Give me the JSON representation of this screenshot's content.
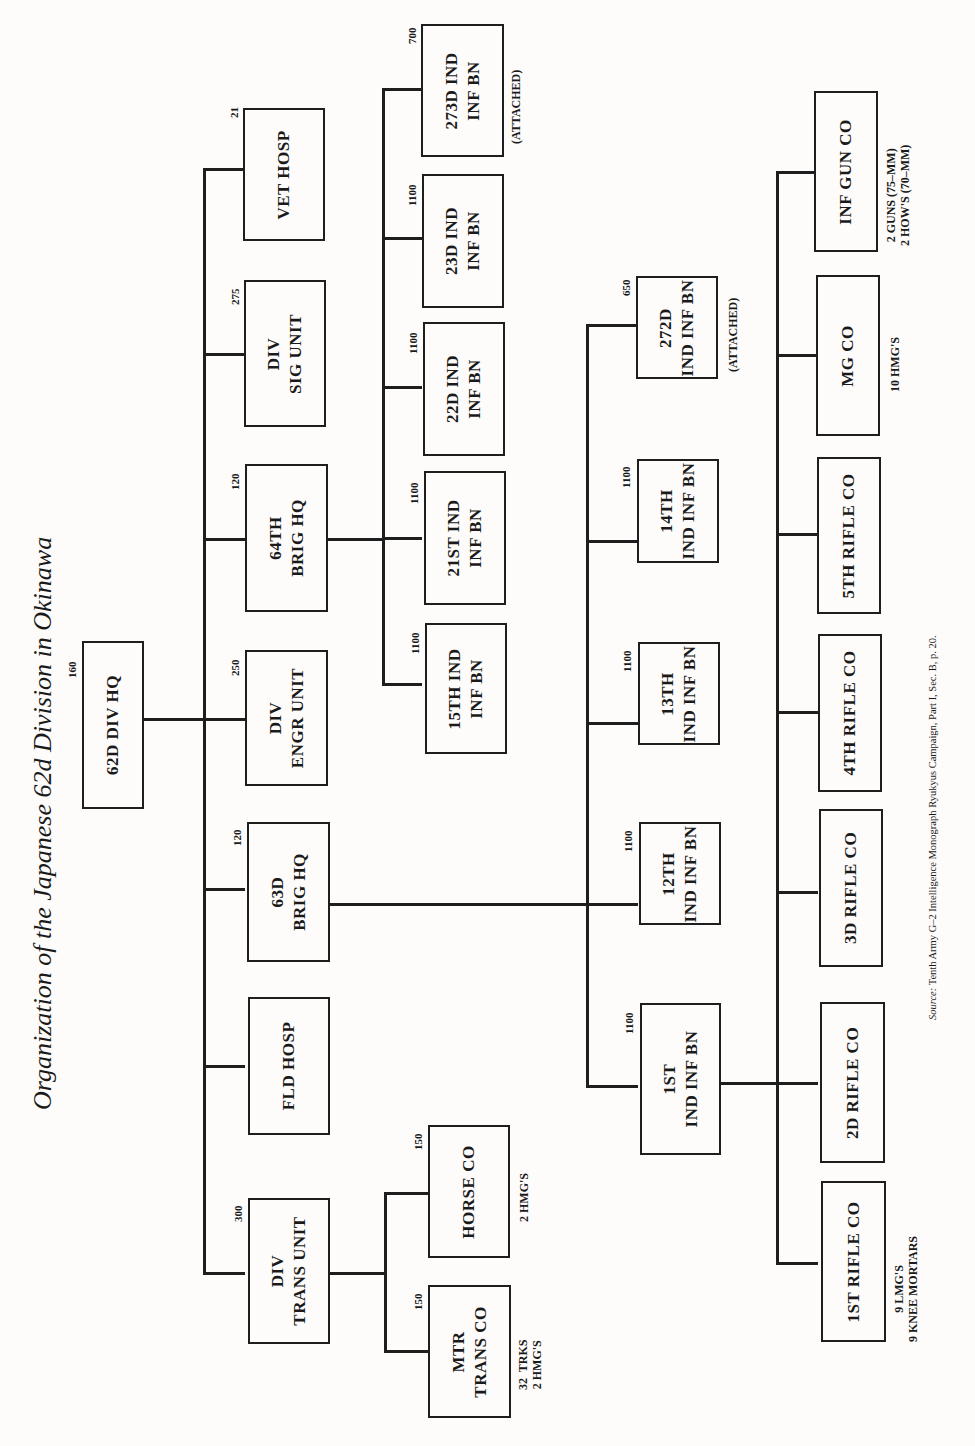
{
  "title": "Organization of the Japanese 62d Division in Okinawa",
  "source": {
    "label": "Source:",
    "text": " Tenth Army G–2 Intelligence Monograph Ryukyus Campaign, Part I, Sec. B, p. 20."
  },
  "units": {
    "div_hq": {
      "label": "62D DIV HQ",
      "strength": "160"
    },
    "vet_hosp": {
      "label": "VET HOSP",
      "strength": "21"
    },
    "sig_unit": {
      "label": "DIV\nSIG UNIT",
      "strength": "275"
    },
    "brig64": {
      "label": "64TH\nBRIG HQ",
      "strength": "120"
    },
    "engr_unit": {
      "label": "DIV\nENGR UNIT",
      "strength": "250"
    },
    "brig63": {
      "label": "63D\nBRIG HQ",
      "strength": "120"
    },
    "fld_hosp": {
      "label": "FLD HOSP",
      "strength": ""
    },
    "trans_unit": {
      "label": "DIV\nTRANS UNIT",
      "strength": "300"
    },
    "horse_co": {
      "label": "HORSE CO",
      "strength": "150",
      "note": "2 HMG'S"
    },
    "mtr_trans_co": {
      "label": "MTR\nTRANS CO",
      "strength": "150",
      "note": "32  TRKS\n2 HMG'S"
    },
    "bn273": {
      "label": "273D IND\nINF BN",
      "strength": "700",
      "note": "(ATTACHED)"
    },
    "bn23": {
      "label": "23D IND\nINF BN",
      "strength": "1100"
    },
    "bn22": {
      "label": "22D IND\nINF BN",
      "strength": "1100"
    },
    "bn21": {
      "label": "21ST IND\nINF BN",
      "strength": "1100"
    },
    "bn15": {
      "label": "15TH IND\nINF BN",
      "strength": "1100"
    },
    "bn272": {
      "label": "272D\nIND INF BN",
      "strength": "650",
      "note": "(ATTACHED)"
    },
    "bn14": {
      "label": "14TH\nIND INF BN",
      "strength": "1100"
    },
    "bn13": {
      "label": "13TH\nIND INF BN",
      "strength": "1100"
    },
    "bn12": {
      "label": "12TH\nIND INF BN",
      "strength": "1100"
    },
    "bn1": {
      "label": "1ST\nIND INF BN",
      "strength": "1100"
    },
    "inf_gun_co": {
      "label": "INF GUN CO",
      "note": "2 GUNS (75–MM)\n2 HOW'S (70–MM)"
    },
    "mg_co": {
      "label": "MG CO",
      "note": "10 HMG'S"
    },
    "rifle5": {
      "label": "5TH RIFLE CO"
    },
    "rifle4": {
      "label": "4TH RIFLE CO"
    },
    "rifle3": {
      "label": "3D RIFLE CO"
    },
    "rifle2": {
      "label": "2D RIFLE CO"
    },
    "rifle1": {
      "label": "1ST RIFLE CO",
      "note": "9 LMG'S\n9 KNEE MORTARS"
    }
  }
}
